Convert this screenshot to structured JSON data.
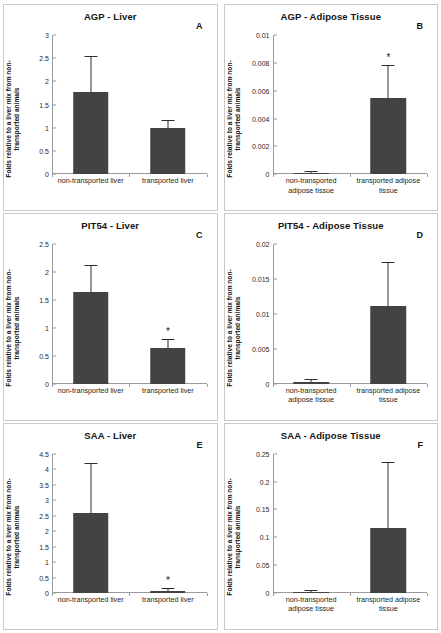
{
  "figure": {
    "ylabel": "Folds relative to a liver mix from non-transported animals",
    "bar_color": "#434343",
    "axis_color": "#9a9a9a",
    "significance_marker": "*"
  },
  "chart_data": [
    {
      "type": "bar",
      "panel": "A",
      "title": "AGP - Liver",
      "xlabel": "",
      "ylabel": "Folds relative to a liver mix from non-transported animals",
      "categories": [
        "non-transported liver",
        "transported liver"
      ],
      "values": [
        1.78,
        1.0
      ],
      "errors_upper": [
        2.53,
        1.14
      ],
      "significance": [
        "",
        ""
      ],
      "ylim": [
        0,
        3
      ],
      "yticks": [
        "0",
        "0.5",
        "1",
        "1.5",
        "2",
        "2.5",
        "3"
      ],
      "ytick_values": [
        0,
        0.5,
        1,
        1.5,
        2,
        2.5,
        3
      ],
      "grid": false,
      "legend": "none"
    },
    {
      "type": "bar",
      "panel": "B",
      "title": "AGP - Adipose Tissue",
      "xlabel": "",
      "ylabel": "Folds relative to a liver mix from non-transported animals",
      "categories": [
        "non-transported adipose tissue",
        "transported adipose tissue"
      ],
      "values": [
        0.0001,
        0.0055
      ],
      "errors_upper": [
        0.00015,
        0.0078
      ],
      "significance": [
        "",
        "*"
      ],
      "ylim": [
        0,
        0.01
      ],
      "yticks": [
        "0",
        "0.002",
        "0.004",
        "0.006",
        "0.008",
        "0.01"
      ],
      "ytick_values": [
        0,
        0.002,
        0.004,
        0.006,
        0.008,
        0.01
      ],
      "grid": false,
      "legend": "none"
    },
    {
      "type": "bar",
      "panel": "C",
      "title": "PIT54 - Liver",
      "xlabel": "",
      "ylabel": "Folds relative to a liver mix from non-transported animals",
      "categories": [
        "non-transported liver",
        "transported liver"
      ],
      "values": [
        1.65,
        0.64
      ],
      "errors_upper": [
        2.12,
        0.78
      ],
      "significance": [
        "",
        "*"
      ],
      "ylim": [
        0,
        2.5
      ],
      "yticks": [
        "0",
        "0.5",
        "1",
        "1.5",
        "2",
        "2.5"
      ],
      "ytick_values": [
        0,
        0.5,
        1,
        1.5,
        2,
        2.5
      ],
      "grid": false,
      "legend": "none"
    },
    {
      "type": "bar",
      "panel": "D",
      "title": "PIT54  - Adipose Tissue",
      "xlabel": "",
      "ylabel": "Folds relative to a liver mix from non-transported animals",
      "categories": [
        "non-transported adipose tissue",
        "transported adipose tissue"
      ],
      "values": [
        0.0003,
        0.0111
      ],
      "errors_upper": [
        0.0005,
        0.0173
      ],
      "significance": [
        "",
        ""
      ],
      "ylim": [
        0,
        0.02
      ],
      "yticks": [
        "0",
        "0.005",
        "0.01",
        "0.015",
        "0.02"
      ],
      "ytick_values": [
        0,
        0.005,
        0.01,
        0.015,
        0.02
      ],
      "grid": false,
      "legend": "none"
    },
    {
      "type": "bar",
      "panel": "E",
      "title": "SAA - Liver",
      "xlabel": "",
      "ylabel": "Folds relative to a liver mix from non-transported animals",
      "categories": [
        "non-transported liver",
        "transported liver"
      ],
      "values": [
        2.57,
        0.08
      ],
      "errors_upper": [
        4.18,
        0.12
      ],
      "significance": [
        "",
        "*"
      ],
      "ylim": [
        0,
        4.5
      ],
      "yticks": [
        "0",
        "0.5",
        "1",
        "1.5",
        "2",
        "2.5",
        "3",
        "3.5",
        "4",
        "4.5"
      ],
      "ytick_values": [
        0,
        0.5,
        1,
        1.5,
        2,
        2.5,
        3,
        3.5,
        4,
        4.5
      ],
      "grid": false,
      "legend": "none"
    },
    {
      "type": "bar",
      "panel": "F",
      "title": "SAA - Adipose Tissue",
      "xlabel": "",
      "ylabel": "Folds relative to a liver mix from non-transported animals",
      "categories": [
        "non-transported adipose tissue",
        "transported adipose tissue"
      ],
      "values": [
        0.002,
        0.116
      ],
      "errors_upper": [
        0.003,
        0.234
      ],
      "significance": [
        "",
        ""
      ],
      "ylim": [
        0,
        0.25
      ],
      "yticks": [
        "0",
        "0.05",
        "0.1",
        "0.15",
        "0.2",
        "0.25"
      ],
      "ytick_values": [
        0,
        0.05,
        0.1,
        0.15,
        0.2,
        0.25
      ],
      "grid": false,
      "legend": "none"
    }
  ]
}
